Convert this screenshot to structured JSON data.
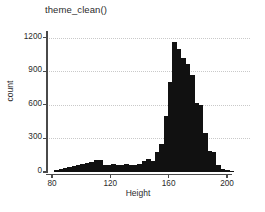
{
  "chart_data": {
    "type": "bar",
    "title": "theme_clean()",
    "xlabel": "Height",
    "ylabel": "count",
    "xlim": [
      80,
      205
    ],
    "ylim": [
      0,
      1250
    ],
    "grid": "horizontal-dotted",
    "legend": "none",
    "bar_color": "#111111",
    "grid_color": "#c9c9c9",
    "axis_color": "#4a4a4a",
    "bin_width": 3,
    "xticks": [
      80,
      120,
      160,
      200
    ],
    "yticks": [
      0,
      300,
      600,
      900,
      1200
    ],
    "categories": [
      83,
      86,
      89,
      92,
      95,
      98,
      101,
      104,
      107,
      110,
      113,
      116,
      119,
      122,
      125,
      128,
      131,
      134,
      137,
      140,
      143,
      146,
      149,
      152,
      155,
      158,
      161,
      164,
      167,
      170,
      173,
      176,
      179,
      182,
      185,
      188,
      191,
      194,
      197,
      200,
      203
    ],
    "values": [
      20,
      30,
      35,
      45,
      55,
      60,
      70,
      80,
      90,
      105,
      110,
      60,
      65,
      70,
      65,
      65,
      70,
      60,
      65,
      70,
      95,
      115,
      95,
      175,
      250,
      500,
      800,
      1160,
      1100,
      1020,
      960,
      870,
      620,
      600,
      350,
      185,
      175,
      60,
      25,
      18,
      10
    ]
  },
  "axis": {
    "x_tick_labels": [
      "80",
      "120",
      "160",
      "200"
    ],
    "y_tick_labels": [
      "0",
      "300",
      "600",
      "900",
      "1200"
    ]
  }
}
